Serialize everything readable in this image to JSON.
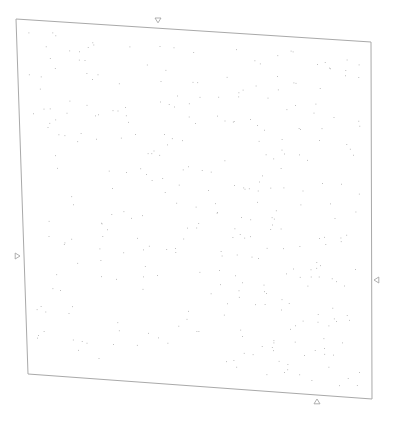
{
  "document": {
    "description": "Blank scanned page with scattered speckle noise",
    "page_corners": {
      "top_left": [
        16,
        19
      ],
      "top_right": [
        371,
        42
      ],
      "bottom_right": [
        372,
        399
      ],
      "bottom_left": [
        28,
        374
      ]
    },
    "colors": {
      "background": "#ffffff",
      "page_border": "#a9a9a9",
      "speck": "#9a9a9a",
      "marker": "#9c9c9c"
    },
    "markers": [
      {
        "name": "top-marker",
        "icon": "triangle-down-icon",
        "x": 158,
        "y": 21,
        "dir": "down"
      },
      {
        "name": "left-marker",
        "icon": "triangle-right-icon",
        "x": 17,
        "y": 256,
        "dir": "right"
      },
      {
        "name": "right-marker",
        "icon": "triangle-left-icon",
        "x": 377,
        "y": 280,
        "dir": "left"
      },
      {
        "name": "bottom-marker",
        "icon": "triangle-up-icon",
        "x": 317,
        "y": 402,
        "dir": "up"
      }
    ],
    "speckle": {
      "count": 330,
      "seed": 7,
      "size": 0.8
    }
  }
}
